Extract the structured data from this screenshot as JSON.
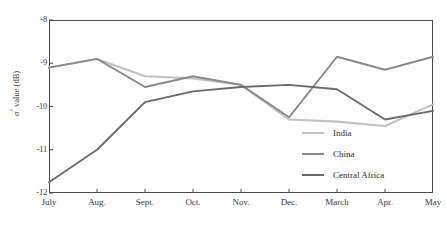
{
  "chart_data": {
    "type": "line",
    "title": "",
    "xlabel": "",
    "ylabel": "σ° value (dB)",
    "categories": [
      "July",
      "Aug.",
      "Sept.",
      "Oct.",
      "Nov.",
      "Dec.",
      "March",
      "Apr.",
      "May"
    ],
    "ylim": [
      -12,
      -8
    ],
    "ytick_labels": [
      "-8",
      "-9",
      "-10",
      "-11",
      "-12"
    ],
    "ytick_values": [
      -8,
      -9,
      -10,
      -11,
      -12
    ],
    "grid": false,
    "legend_position": "inside-bottom-right",
    "series": [
      {
        "name": "India",
        "color": "#c2c2c2",
        "values": [
          -9.1,
          -8.9,
          -9.3,
          -9.35,
          -9.5,
          -10.3,
          -10.35,
          -10.45,
          -9.95
        ]
      },
      {
        "name": "China",
        "color": "#8a8a8a",
        "values": [
          -9.1,
          -8.9,
          -9.55,
          -9.3,
          -9.5,
          -10.25,
          -8.85,
          -9.15,
          -8.85
        ]
      },
      {
        "name": "Central Africa",
        "color": "#6b6b6b",
        "values": [
          -11.75,
          -11.0,
          -9.9,
          -9.65,
          -9.55,
          -9.5,
          -9.6,
          -10.3,
          -10.1
        ]
      }
    ]
  },
  "axis": {
    "frame_color": "#4a4a4a"
  }
}
